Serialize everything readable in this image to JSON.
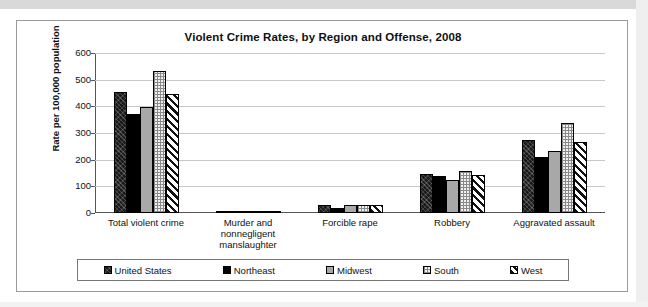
{
  "page": {
    "background_color": "#ffffff",
    "frame_border_color": "#9a9a9a"
  },
  "chart_data": {
    "type": "bar",
    "title": "Violent Crime Rates, by Region and Offense, 2008",
    "xlabel": "",
    "ylabel": "Rate per 100,000 population",
    "ylim": [
      0,
      600
    ],
    "ytick_labels": [
      "600",
      "500",
      "400",
      "300",
      "200",
      "100",
      "0"
    ],
    "yticks": [
      600,
      500,
      400,
      300,
      200,
      100,
      0
    ],
    "grid": true,
    "legend_position": "bottom",
    "categories": [
      "Total violent crime",
      "Murder and nonnegligent manslaughter",
      "Forcible rape",
      "Robbery",
      "Aggravated assault"
    ],
    "category_label_lines": [
      [
        "Total violent crime"
      ],
      [
        "Murder and",
        "nonnegligent",
        "manslaughter"
      ],
      [
        "Forcible rape"
      ],
      [
        "Robbery"
      ],
      [
        "Aggravated assault"
      ]
    ],
    "series": [
      {
        "name": "United States",
        "pattern": "dark-textured",
        "color": "#1a1a1a",
        "values": [
          455,
          5.4,
          29.3,
          145.3,
          274.6
        ]
      },
      {
        "name": "Northeast",
        "pattern": "solid-black",
        "color": "#000000",
        "values": [
          372,
          4.2,
          18.4,
          139.3,
          210.0
        ]
      },
      {
        "name": "Midwest",
        "pattern": "solid-gray",
        "color": "#a8a8a8",
        "values": [
          399,
          4.7,
          31.0,
          125.0,
          232.0
        ]
      },
      {
        "name": "South",
        "pattern": "dotted-checker",
        "color": "#f0f0f0",
        "values": [
          534,
          6.6,
          30.1,
          158.0,
          339.0
        ]
      },
      {
        "name": "West",
        "pattern": "diagonal-hatch",
        "color": "#ffffff",
        "values": [
          445,
          5.0,
          29.5,
          144.0,
          266.0
        ]
      }
    ]
  },
  "legend": {
    "items": [
      {
        "label": "United States"
      },
      {
        "label": "Northeast"
      },
      {
        "label": "Midwest"
      },
      {
        "label": "South"
      },
      {
        "label": "West"
      }
    ]
  }
}
